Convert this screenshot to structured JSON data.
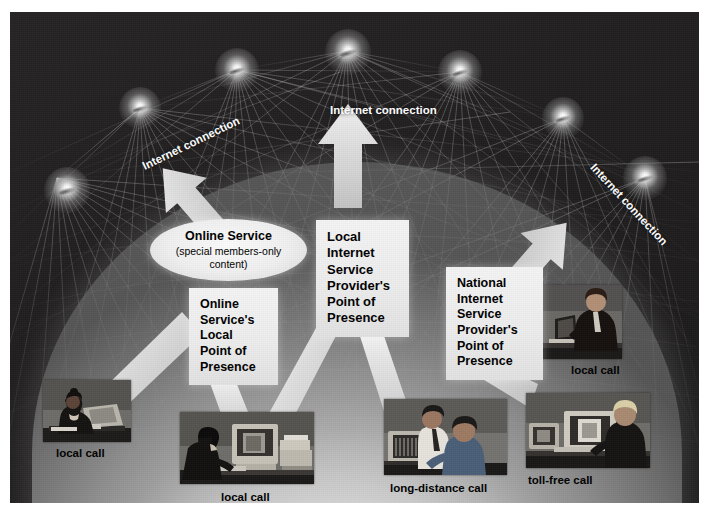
{
  "diagram": {
    "background_color": "#221f20",
    "dome_color": "#cccccc"
  },
  "network_labels": [
    {
      "id": "ic-top",
      "line1": "Internet",
      "line2": "connection"
    },
    {
      "id": "ic-left",
      "line1": "Internet",
      "line2": "connection"
    },
    {
      "id": "ic-right",
      "line1": "Internet",
      "line2": "connection"
    }
  ],
  "callout": {
    "title": "Online Service",
    "subtitle_line1": "(special members-only",
    "subtitle_line2": "content)"
  },
  "boxes": [
    {
      "id": "box-online-local",
      "lines": [
        "Online",
        "Service's",
        "Local",
        "Point of",
        "Presence"
      ]
    },
    {
      "id": "box-local-isp",
      "lines": [
        "Local",
        "Internet",
        "Service",
        "Provider's",
        "Point of",
        "Presence"
      ]
    },
    {
      "id": "box-national-isp",
      "lines": [
        "National",
        "Internet",
        "Service",
        "Provider's",
        "Point of",
        "Presence"
      ]
    }
  ],
  "photos": [
    {
      "id": "photo-woman-terminal",
      "caption": "local call"
    },
    {
      "id": "photo-woman-desktop",
      "caption": "local call"
    },
    {
      "id": "photo-two-men",
      "caption": "long-distance call"
    },
    {
      "id": "photo-man-desktop",
      "caption": "toll-free call"
    },
    {
      "id": "photo-man-laptop",
      "caption": "local call"
    }
  ],
  "nodes": [
    {
      "x": 57,
      "y": 178,
      "r": 23
    },
    {
      "x": 140,
      "y": 108,
      "r": 21
    },
    {
      "x": 237,
      "y": 70,
      "r": 22
    },
    {
      "x": 347,
      "y": 51,
      "r": 23
    },
    {
      "x": 460,
      "y": 72,
      "r": 22
    },
    {
      "x": 563,
      "y": 118,
      "r": 21
    },
    {
      "x": 645,
      "y": 178,
      "r": 22
    }
  ]
}
